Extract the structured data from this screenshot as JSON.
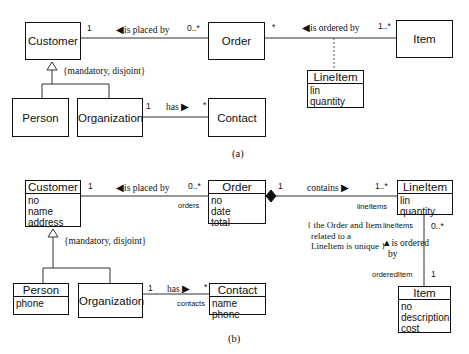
{
  "diagram_a": {
    "caption": "(a)",
    "classes": {
      "customer": "Customer",
      "order": "Order",
      "item": "Item",
      "lineitem": {
        "name": "LineItem",
        "attrs": [
          "lin",
          "quantity"
        ]
      },
      "person": "Person",
      "organization": "Organization",
      "contact": "Contact"
    },
    "associations": {
      "placed_by": {
        "label": "◀is placed by",
        "mult_left": "1",
        "mult_right": "0..*"
      },
      "ordered_by": {
        "label": "◀is ordered by",
        "mult_left": "*",
        "mult_right": "1..*"
      },
      "has": {
        "label": "has ▶",
        "mult_left": "1",
        "mult_right": "*"
      }
    },
    "generalization_constraint": "{mandatory, disjoint}"
  },
  "diagram_b": {
    "caption": "(b)",
    "classes": {
      "customer": {
        "name": "Customer",
        "attrs": [
          "no",
          "name",
          "address"
        ]
      },
      "order": {
        "name": "Order",
        "attrs": [
          "no",
          "date",
          "total"
        ]
      },
      "lineitem": {
        "name": "LineItem",
        "attrs": [
          "lin",
          "quantity"
        ]
      },
      "person": {
        "name": "Person",
        "attrs": [
          "phone"
        ]
      },
      "organization": "Organization",
      "contact": {
        "name": "Contact",
        "attrs": [
          "name",
          "phone"
        ]
      },
      "item": {
        "name": "Item",
        "attrs": [
          "no",
          "description",
          "cost"
        ]
      }
    },
    "associations": {
      "placed_by": {
        "label": "◀is placed by",
        "mult_left": "1",
        "mult_right": "0..*",
        "role_right": "orders"
      },
      "contains": {
        "label": "contains ▶",
        "mult_left": "1",
        "mult_right": "1..*",
        "role_right": "lineItems"
      },
      "has": {
        "label": "has ▶",
        "mult_left": "1",
        "mult_right": "*",
        "role_right": "contacts"
      },
      "ordered_by": {
        "label_line1": "▲is ordered",
        "label_line2": "by",
        "mult_top": "0..*",
        "role_top": "lineItems",
        "mult_bottom": "1",
        "role_bottom": "orderedItem"
      }
    },
    "generalization_constraint": "{mandatory, disjoint}",
    "constraint_note": [
      "{ the Order and Item",
      "related to a",
      "LineItem is unique }"
    ]
  }
}
